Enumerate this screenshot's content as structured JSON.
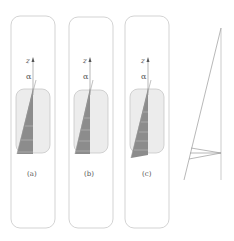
{
  "figure": {
    "panels": [
      {
        "id": "a",
        "label": "(a)",
        "axis_label": "z",
        "angle_label": "α",
        "x": 11,
        "stripes": [
          126,
          140,
          152
        ]
      },
      {
        "id": "b",
        "label": "(b)",
        "axis_label": "z",
        "angle_label": "α",
        "x": 69,
        "stripes": [
          118,
          130,
          141,
          151
        ]
      },
      {
        "id": "c",
        "label": "(c)",
        "axis_label": "z",
        "angle_label": "α",
        "x": 125,
        "stripes": [
          112,
          122,
          132,
          141,
          150
        ]
      }
    ],
    "colors": {
      "outline": "#c8c8c8",
      "inner_fill": "#ececec",
      "inner_stroke": "#c8c8c8",
      "wedge": "#8c8c8c",
      "stripe": "#b4b4b4",
      "line": "#999999"
    }
  }
}
